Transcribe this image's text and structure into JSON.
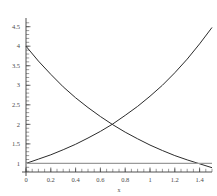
{
  "chart_data": {
    "type": "line",
    "title": "",
    "xlabel": "x",
    "ylabel": "",
    "xlim": [
      0,
      1.5
    ],
    "ylim": [
      0.78,
      4.62
    ],
    "grid": false,
    "legend_position": "none",
    "x_ticks": [
      0,
      0.2,
      0.4,
      0.6,
      0.8,
      1,
      1.2,
      1.4
    ],
    "x_tick_labels": [
      "0",
      "0.2",
      "0.4",
      "0.6",
      "0.8",
      "1",
      "1.2",
      "1.4"
    ],
    "x_minor_tick_step": 0.05,
    "y_ticks": [
      1,
      1.5,
      2,
      2.5,
      3,
      3.5,
      4,
      4.5
    ],
    "y_tick_labels": [
      "1",
      "1.5",
      "2",
      "2.5",
      "3",
      "3.5",
      "4",
      "4.5"
    ],
    "y_minor_tick_step": 0.1,
    "series": [
      {
        "name": "decreasing-exponential",
        "color": "#2b2b2b",
        "x": [
          0,
          0.1,
          0.2,
          0.3,
          0.4,
          0.5,
          0.6,
          0.7,
          0.8,
          0.9,
          1,
          1.1,
          1.2,
          1.3,
          1.4,
          1.5
        ],
        "values": [
          4,
          3.62,
          3.28,
          2.96,
          2.68,
          2.43,
          2.2,
          1.99,
          1.8,
          1.63,
          1.47,
          1.33,
          1.2,
          1.09,
          0.99,
          0.89
        ]
      },
      {
        "name": "increasing-exponential",
        "color": "#2b2b2b",
        "x": [
          0,
          0.1,
          0.2,
          0.3,
          0.4,
          0.5,
          0.6,
          0.7,
          0.8,
          0.9,
          1,
          1.1,
          1.2,
          1.3,
          1.4,
          1.5
        ],
        "values": [
          1,
          1.11,
          1.22,
          1.35,
          1.49,
          1.65,
          1.82,
          2.01,
          2.23,
          2.46,
          2.72,
          3.0,
          3.32,
          3.67,
          4.06,
          4.48
        ]
      },
      {
        "name": "horizontal-reference-line",
        "color": "#9a9a9a",
        "x": [
          0,
          1.5
        ],
        "values": [
          1,
          1
        ]
      }
    ],
    "annotations": {
      "intersection_x": 0.69,
      "intersection_y": 2.0
    }
  }
}
